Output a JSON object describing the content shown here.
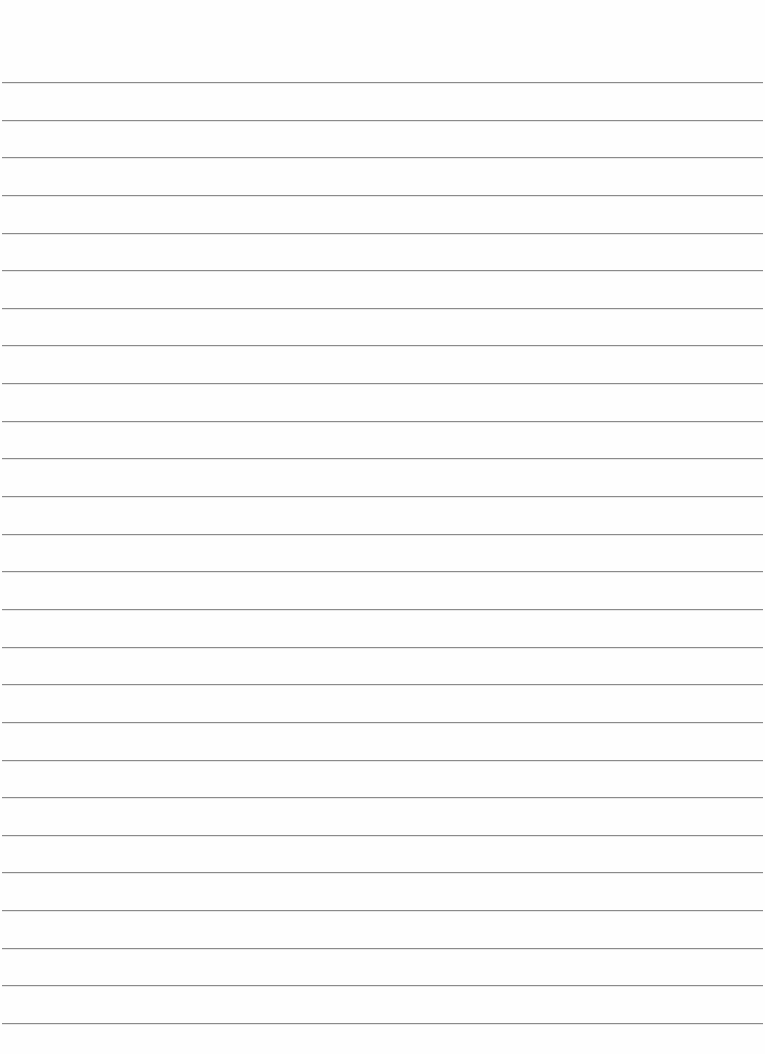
{
  "page": {
    "type": "lined-paper",
    "background_color": "#fefefe",
    "line_color": "#8a8a8a",
    "line_count": 26,
    "first_line_y": 82,
    "line_spacing": 37.64,
    "line_left": 2,
    "line_width": 761
  }
}
